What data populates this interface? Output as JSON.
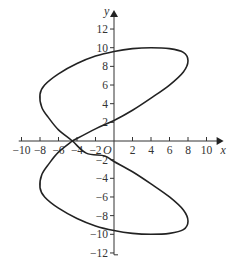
{
  "chart_data": {
    "type": "line",
    "title": "",
    "xlabel": "x",
    "ylabel": "y",
    "origin_label": "O",
    "xlim": [
      -10.5,
      11.5
    ],
    "ylim": [
      -12.5,
      13.5
    ],
    "x_ticks": [
      -10,
      -8,
      -6,
      -4,
      -2,
      2,
      4,
      6,
      8,
      10
    ],
    "y_ticks": [
      -12,
      -10,
      -8,
      -6,
      -4,
      -2,
      2,
      4,
      6,
      8,
      10,
      12
    ],
    "grid": false,
    "series": [
      {
        "name": "closed curve",
        "closed": true,
        "points": [
          [
            -4.5,
            0
          ],
          [
            -2,
            1.3
          ],
          [
            0,
            2.2
          ],
          [
            2,
            3.3
          ],
          [
            4,
            4.6
          ],
          [
            6,
            6.0
          ],
          [
            7.5,
            7.4
          ],
          [
            8,
            8.6
          ],
          [
            7.5,
            9.5
          ],
          [
            6,
            9.9
          ],
          [
            4,
            10.0
          ],
          [
            2,
            9.9
          ],
          [
            0,
            9.6
          ],
          [
            -2,
            9.1
          ],
          [
            -4,
            8.3
          ],
          [
            -6,
            7.2
          ],
          [
            -7.5,
            6.0
          ],
          [
            -8,
            5.0
          ],
          [
            -7.8,
            3.6
          ],
          [
            -7,
            2.4
          ],
          [
            -6,
            1.2
          ],
          [
            -4.5,
            0
          ],
          [
            -3,
            -1.3
          ],
          [
            -1,
            -1.6
          ],
          [
            0,
            -2.2
          ],
          [
            2,
            -3.3
          ],
          [
            4,
            -4.6
          ],
          [
            6,
            -6.0
          ],
          [
            7.5,
            -7.4
          ],
          [
            8,
            -8.6
          ],
          [
            7.5,
            -9.5
          ],
          [
            6,
            -9.9
          ],
          [
            4,
            -10.0
          ],
          [
            2,
            -9.9
          ],
          [
            0,
            -9.6
          ],
          [
            -2,
            -9.1
          ],
          [
            -4,
            -8.3
          ],
          [
            -6,
            -7.2
          ],
          [
            -7.5,
            -6.0
          ],
          [
            -8,
            -5.0
          ],
          [
            -7.8,
            -3.6
          ],
          [
            -7,
            -2.4
          ],
          [
            -6,
            -1.2
          ],
          [
            -4.5,
            0
          ]
        ]
      }
    ]
  }
}
